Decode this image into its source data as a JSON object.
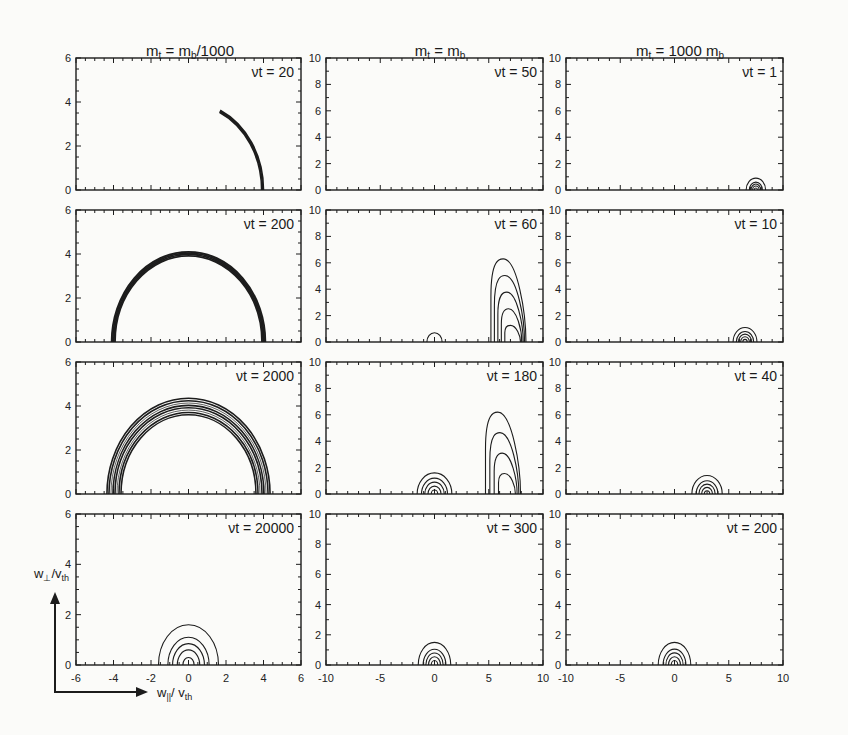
{
  "figure": {
    "columns": [
      {
        "title_main": "m",
        "title_sub": "t",
        "title_rest": " =  m",
        "title_sub2": "b",
        "title_tail": "/1000"
      },
      {
        "title_main": "m",
        "title_sub": "t",
        "title_rest": " =  m",
        "title_sub2": "b",
        "title_tail": ""
      },
      {
        "title_main": "m",
        "title_sub": "t",
        "title_rest": " = 1000 m",
        "title_sub2": "b",
        "title_tail": ""
      }
    ],
    "y_axis_title": {
      "main": "w",
      "sub": "⊥",
      "rest": "/v",
      "sub2": "th"
    },
    "x_axis_title": {
      "main": "w",
      "sub": "||",
      "rest": "/ v",
      "sub2": "th"
    }
  },
  "chart_data": {
    "type": "contour-grid",
    "xlabel": "w_|| / v_th",
    "ylabel": "w_⊥ / v_th",
    "layout": {
      "rows": 4,
      "cols": 3,
      "grid": false,
      "legend": "none"
    },
    "columns": [
      {
        "label": "m_t = m_b/1000",
        "xlim": [
          -6,
          6
        ],
        "ylim": [
          0,
          6
        ],
        "xticks": [
          -6,
          -4,
          -2,
          0,
          2,
          4,
          6
        ],
        "yticks": [
          0,
          2,
          4,
          6
        ],
        "panels": [
          {
            "label": "νt = 20",
            "shape": "thin arc",
            "radius": 4.0,
            "arc_from_deg": 0,
            "arc_to_deg": 65,
            "contours": 3
          },
          {
            "label": "νt = 200",
            "shape": "thin semicircle shell",
            "radius": 4.1,
            "center_x": 0,
            "contours": 4
          },
          {
            "label": "νt = 2000",
            "shape": "broad semicircle shell",
            "radius_inner": 3.6,
            "radius_outer": 4.35,
            "center_x": 0,
            "contours": 8
          },
          {
            "label": "νt = 20000",
            "shape": "concentric semicircles",
            "center_x": 0,
            "radii": [
              0.3,
              0.6,
              0.85,
              1.1,
              1.6
            ]
          }
        ]
      },
      {
        "label": "m_t = m_b",
        "xlim": [
          -10,
          10
        ],
        "ylim": [
          0,
          10
        ],
        "xticks": [
          -10,
          -5,
          0,
          5,
          10
        ],
        "yticks": [
          0,
          2,
          4,
          6,
          8,
          10
        ],
        "panels": [
          {
            "label": "νt = 50",
            "shape": "narrow beam lobe",
            "center_x": 8.0,
            "peak_height": 4.2,
            "contours": 5
          },
          {
            "label": "νt = 60",
            "shape": "beam lobe + small core",
            "beam_center_x": 7.0,
            "beam_peak_height": 6.3,
            "beam_contours": 5,
            "core_center_x": 0,
            "core_radius": 0.7
          },
          {
            "label": "νt = 180",
            "shape": "beam lobe + core",
            "beam_center_x": 6.5,
            "beam_peak_height": 6.2,
            "beam_contours": 4,
            "core_center_x": 0,
            "core_radii": [
              0.3,
              0.6,
              0.9,
              1.2,
              1.6
            ]
          },
          {
            "label": "νt = 300",
            "shape": "concentric semicircles",
            "center_x": 0,
            "radii": [
              0.3,
              0.55,
              0.8,
              1.05,
              1.5
            ]
          }
        ]
      },
      {
        "label": "m_t = 1000 m_b",
        "xlim": [
          -10,
          10
        ],
        "ylim": [
          0,
          10
        ],
        "xticks": [
          -10,
          -5,
          0,
          5,
          10
        ],
        "yticks": [
          0,
          2,
          4,
          6,
          8,
          10
        ],
        "panels": [
          {
            "label": "νt = 1",
            "shape": "concentric semicircles",
            "center_x": 7.5,
            "radii": [
              0.15,
              0.3,
              0.45,
              0.6,
              0.9
            ]
          },
          {
            "label": "νt = 10",
            "shape": "concentric semicircles",
            "center_x": 6.5,
            "radii": [
              0.2,
              0.4,
              0.6,
              0.8,
              1.1
            ]
          },
          {
            "label": "νt = 40",
            "shape": "concentric semicircles",
            "center_x": 3.0,
            "radii": [
              0.25,
              0.5,
              0.75,
              1.0,
              1.4
            ]
          },
          {
            "label": "νt = 200",
            "shape": "concentric semicircles",
            "center_x": 0,
            "radii": [
              0.3,
              0.55,
              0.8,
              1.05,
              1.5
            ]
          }
        ]
      }
    ]
  }
}
